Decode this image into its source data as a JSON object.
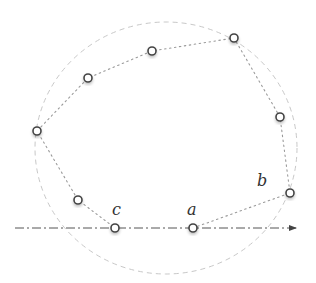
{
  "diagram": {
    "width": 316,
    "height": 283,
    "circle": {
      "cx": 166,
      "cy": 148,
      "rx": 131,
      "ry": 126,
      "stroke": "#c8c8c8"
    },
    "axis": {
      "x1": 15,
      "y1": 228,
      "x2": 296,
      "y2": 228,
      "stroke": "#555555",
      "arrow": "arrow-right"
    },
    "points": [
      {
        "id": "a",
        "x": 193,
        "y": 228,
        "label": "a"
      },
      {
        "id": "b",
        "x": 290,
        "y": 193,
        "label": "b"
      },
      {
        "id": "p3",
        "x": 280,
        "y": 117,
        "label": ""
      },
      {
        "id": "p4",
        "x": 234,
        "y": 38,
        "label": ""
      },
      {
        "id": "p5",
        "x": 152,
        "y": 51,
        "label": ""
      },
      {
        "id": "p6",
        "x": 88,
        "y": 78,
        "label": ""
      },
      {
        "id": "p7",
        "x": 37,
        "y": 131,
        "label": ""
      },
      {
        "id": "p8",
        "x": 78,
        "y": 200,
        "label": ""
      },
      {
        "id": "c",
        "x": 115,
        "y": 228,
        "label": "c"
      }
    ],
    "labels": [
      {
        "text": "c",
        "x": 112,
        "y": 215
      },
      {
        "text": "a",
        "x": 187,
        "y": 215
      },
      {
        "text": "b",
        "x": 257,
        "y": 186
      }
    ],
    "path_stroke": "#9a9a9a",
    "point_stroke": "#444444"
  }
}
